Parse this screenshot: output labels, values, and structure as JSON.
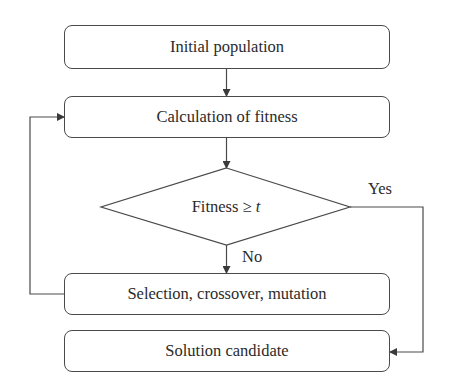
{
  "diagram": {
    "type": "flowchart",
    "title": "",
    "nodes": [
      {
        "id": "init",
        "shape": "rounded-rect",
        "label": "Initial population"
      },
      {
        "id": "fitness_calc",
        "shape": "rounded-rect",
        "label": "Calculation of fitness"
      },
      {
        "id": "decision",
        "shape": "diamond",
        "label_prefix": "Fitness ≥ ",
        "label_var": "t"
      },
      {
        "id": "operators",
        "shape": "rounded-rect",
        "label": "Selection, crossover, mutation"
      },
      {
        "id": "solution",
        "shape": "rounded-rect",
        "label": "Solution candidate"
      }
    ],
    "edges": [
      {
        "from": "init",
        "to": "fitness_calc",
        "label": ""
      },
      {
        "from": "fitness_calc",
        "to": "decision",
        "label": ""
      },
      {
        "from": "decision",
        "to": "operators",
        "label": "No"
      },
      {
        "from": "decision",
        "to": "solution",
        "label": "Yes"
      },
      {
        "from": "operators",
        "to": "fitness_calc",
        "label": ""
      }
    ],
    "edge_labels": {
      "yes": "Yes",
      "no": "No"
    },
    "colors": {
      "line": "#4a4a4a",
      "text": "#2b2b2b",
      "background": "#ffffff"
    }
  }
}
